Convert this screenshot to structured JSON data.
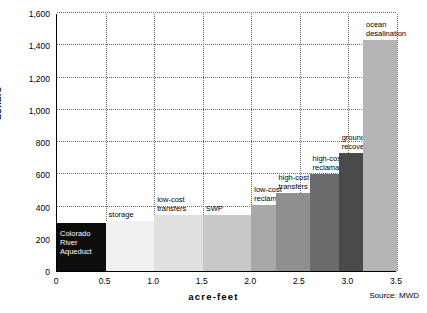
{
  "chart_data": {
    "type": "bar",
    "title": "",
    "xlabel": "acre-feet",
    "ylabel": "dollars",
    "source": "Source: MWD",
    "xlim": [
      0,
      3.5
    ],
    "ylim": [
      0,
      1600
    ],
    "yticks": [
      "0",
      "200",
      "400",
      "600",
      "800",
      "1,000",
      "1,200",
      "1,400",
      "1,600"
    ],
    "ytick_values": [
      0,
      200,
      400,
      600,
      800,
      1000,
      1200,
      1400,
      1600
    ],
    "xticks": [
      "0",
      "0.5",
      "1.0",
      "1.5",
      "2.0",
      "2.5",
      "3.0",
      "3.5"
    ],
    "xtick_values": [
      0,
      0.5,
      1.0,
      1.5,
      2.0,
      2.5,
      3.0,
      3.5
    ],
    "grid": "horizontal-and-vertical-dotted",
    "legend": "none",
    "bars": [
      {
        "label": "Colorado\nRiver\nAqueduct",
        "x0": 0.0,
        "x1": 0.5,
        "value": 300,
        "color": "#0d0d0d",
        "label_color": "#ffffff"
      },
      {
        "label": "storage",
        "x0": 0.5,
        "x1": 1.0,
        "value": 310,
        "color": "#f0f0f0",
        "label_color": "#000000"
      },
      {
        "label": "low-cost\ntransfers",
        "x0": 1.0,
        "x1": 1.5,
        "value": 345,
        "color": "#e0e0e0",
        "label_color": "#000000"
      },
      {
        "label": "SWP",
        "x0": 1.5,
        "x1": 2.0,
        "value": 350,
        "color": "#c8c8c8",
        "label_color": "#000000"
      },
      {
        "label": "low-cost\nreclamation",
        "x0": 2.0,
        "x1": 2.25,
        "value": 410,
        "color": "#a8a8a8",
        "label_color": "#000000"
      },
      {
        "label": "high-cost\ntransfers",
        "x0": 2.25,
        "x1": 2.6,
        "value": 485,
        "color": "#8f8f8f",
        "label_color": "#000000"
      },
      {
        "label": "high-cost\nreclamation",
        "x0": 2.6,
        "x1": 2.9,
        "value": 600,
        "color": "#6b6b6b",
        "label_color": "#000000"
      },
      {
        "label": "groundwater\nrecovery",
        "x0": 2.9,
        "x1": 3.15,
        "value": 730,
        "color": "#4a4a4a",
        "label_color": "#000000"
      },
      {
        "label": "ocean\ndesalination",
        "x0": 3.15,
        "x1": 3.5,
        "value": 1430,
        "color": "#b5b5b5",
        "label_color": "#000000"
      }
    ]
  }
}
